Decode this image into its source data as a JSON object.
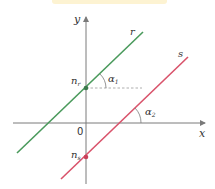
{
  "diagram": {
    "axes": {
      "x_label": "x",
      "y_label": "y",
      "origin_label": "0"
    },
    "lines": [
      {
        "name": "r",
        "label": "r",
        "color": "#4a9a5c",
        "intercept_label": "n",
        "intercept_sub": "r",
        "angle_label": "α",
        "angle_sub": "1"
      },
      {
        "name": "s",
        "label": "s",
        "color": "#d9536b",
        "intercept_label": "n",
        "intercept_sub": "s",
        "angle_label": "α",
        "angle_sub": "2"
      }
    ],
    "colors": {
      "axis": "#7a7a7a",
      "dashed": "#9a9a9a",
      "band": "#fdf3d2"
    }
  }
}
